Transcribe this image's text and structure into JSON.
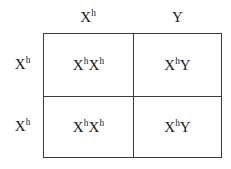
{
  "diagram": {
    "type": "punnett-square",
    "rows": 2,
    "columns": 2,
    "line_color": "#3a3a3a",
    "background_color": "#ffffff",
    "text_color": "#1a1a1a"
  },
  "column_headers": [
    {
      "base": "X",
      "sup": "h",
      "text": "Xʰ"
    },
    {
      "base": "Y",
      "sup": "",
      "text": "Y"
    }
  ],
  "row_headers": [
    {
      "base": "X",
      "sup": "h",
      "text": "Xʰ"
    },
    {
      "base": "X",
      "sup": "h",
      "text": "Xʰ"
    }
  ],
  "cells": [
    [
      {
        "alleles": [
          {
            "base": "X",
            "sup": "h"
          },
          {
            "base": "X",
            "sup": "h"
          }
        ],
        "text": "XhXh"
      },
      {
        "alleles": [
          {
            "base": "X",
            "sup": "h"
          },
          {
            "base": "Y",
            "sup": ""
          }
        ],
        "text": "XhY"
      }
    ],
    [
      {
        "alleles": [
          {
            "base": "X",
            "sup": "h"
          },
          {
            "base": "X",
            "sup": "h"
          }
        ],
        "text": "XhXh"
      },
      {
        "alleles": [
          {
            "base": "X",
            "sup": "h"
          },
          {
            "base": "Y",
            "sup": ""
          }
        ],
        "text": "XhY"
      }
    ]
  ]
}
